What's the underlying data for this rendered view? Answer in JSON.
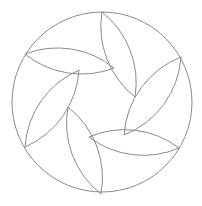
{
  "diagram": {
    "type": "rosette",
    "stroke_color": "#8a8a8a",
    "background": "#ffffff",
    "outer_circle": {
      "cx": 102,
      "cy": 102,
      "r": 90
    },
    "arc_radius": 90,
    "petals": [
      {
        "outer": [
          102,
          12
        ],
        "inner": [
          135,
          97
        ]
      },
      {
        "outer": [
          181,
          57
        ],
        "inner": [
          124,
          135
        ]
      },
      {
        "outer": [
          179,
          148
        ],
        "inner": [
          89,
          137
        ]
      },
      {
        "outer": [
          101,
          194
        ],
        "inner": [
          68,
          107
        ]
      },
      {
        "outer": [
          25,
          147
        ],
        "inner": [
          79,
          70
        ]
      },
      {
        "outer": [
          25,
          54
        ],
        "inner": [
          114,
          68
        ]
      }
    ]
  }
}
